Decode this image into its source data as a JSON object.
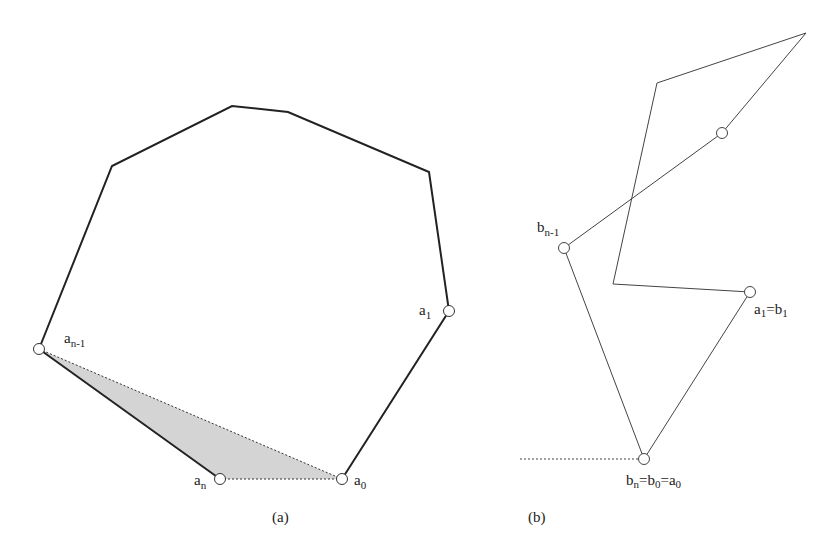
{
  "figure_a": {
    "caption": "(a)",
    "labels": {
      "a_n_minus_1": {
        "base": "a",
        "sub": "n-1"
      },
      "a_1": {
        "base": "a",
        "sub": "1"
      },
      "a_n": {
        "base": "a",
        "sub": "n"
      },
      "a_0": {
        "base": "a",
        "sub": "0"
      }
    },
    "polygon_points": "39,349 112,166 232,106 288,112 429,172 449,311 342,479",
    "shaded_triangle": "39,349 220,479 342,479",
    "colors": {
      "stroke": "#222222",
      "fill": "#d4d4d4"
    }
  },
  "figure_b": {
    "caption": "(b)",
    "labels": {
      "b_n_minus_1": {
        "base": "b",
        "sub": "n-1"
      },
      "a1_eq_b1": {
        "p1": "a",
        "s1": "1",
        "eq": "=b",
        "s2": "1"
      },
      "bn_eq_b0_eq_a0": {
        "p1": "b",
        "s1": "n",
        "p2": "=b",
        "s2": "0",
        "p3": "=a",
        "s3": "0"
      }
    },
    "chain_points": "644,459 564,248 722,133 806,33 657,83 613,284 750,292 644,459",
    "colors": {
      "stroke": "#444444"
    }
  }
}
